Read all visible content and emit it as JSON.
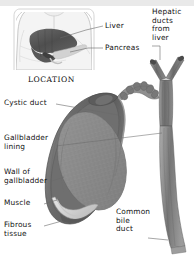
{
  "figure": {
    "background": "#ffffff",
    "top_band_color": "#e9e9e9"
  },
  "inset": {
    "caption": "LOCATION",
    "labels": [
      {
        "id": "liver",
        "text": "Liver"
      },
      {
        "id": "pancreas",
        "text": "Pancreas"
      }
    ]
  },
  "main": {
    "labels": [
      {
        "id": "hepatic-ducts-from-liver",
        "text": "Hepatic\nducts\nfrom\nliver"
      },
      {
        "id": "cystic-duct",
        "text": "Cystic duct"
      },
      {
        "id": "gallbladder-lining",
        "text": "Gallbladder\nlining"
      },
      {
        "id": "wall-of-gallbladder",
        "text": "Wall of\ngallbladder"
      },
      {
        "id": "muscle",
        "text": "Muscle"
      },
      {
        "id": "fibrous-tissue",
        "text": "Fibrous\ntissue"
      },
      {
        "id": "common-bile-duct",
        "text": "Common\nbile\nduct"
      }
    ]
  },
  "palette": {
    "ink": "#121212",
    "leader_line": "#5a5a5a",
    "torso_outline": "#b4b4b4",
    "torso_fill": "#f1f1f1",
    "liver_dark": "#4e4e4e",
    "liver_mid": "#6e6e6e",
    "pancreas": "#cfcfcf",
    "gb_wall_dark": "#5e5e5e",
    "gb_wall_mid": "#7d7d7d",
    "gb_lining": "#8c8c8c",
    "gb_lining_dark": "#767676",
    "fibrous_pale": "#dcdcdc",
    "duct_mid": "#8a8a8a",
    "duct_dark": "#5f5f5f"
  }
}
